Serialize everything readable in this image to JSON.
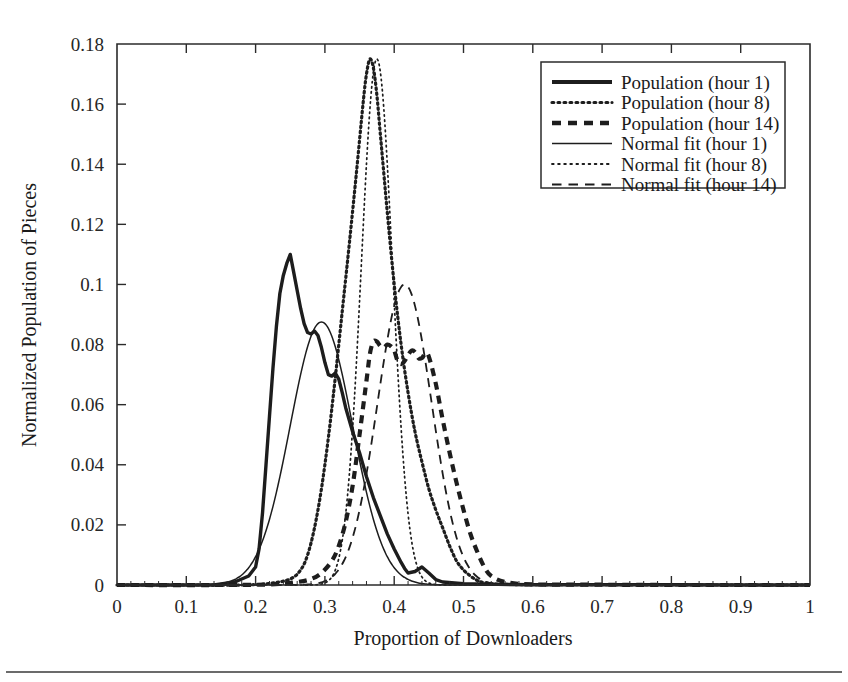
{
  "chart_data": {
    "type": "line",
    "title": "",
    "xlabel": "Proportion of Downloaders",
    "ylabel": "Normalized Population of Pieces",
    "xlim": [
      0,
      1
    ],
    "ylim": [
      0,
      0.18
    ],
    "grid": false,
    "legend_position": "top-right",
    "xticks": [
      "0",
      "0.1",
      "0.2",
      "0.3",
      "0.4",
      "0.5",
      "0.6",
      "0.7",
      "0.8",
      "0.9",
      "1"
    ],
    "xtick_values": [
      0,
      0.1,
      0.2,
      0.3,
      0.4,
      0.5,
      0.6,
      0.7,
      0.8,
      0.9,
      1
    ],
    "yticks": [
      "0",
      "0.02",
      "0.04",
      "0.06",
      "0.08",
      "0.1",
      "0.12",
      "0.14",
      "0.16",
      "0.18"
    ],
    "ytick_values": [
      0,
      0.02,
      0.04,
      0.06,
      0.08,
      0.1,
      0.12,
      0.14,
      0.16,
      0.18
    ],
    "series": [
      {
        "name": "Population (hour 1)",
        "style": "thick-solid",
        "x": [
          0.0,
          0.05,
          0.1,
          0.14,
          0.17,
          0.19,
          0.2,
          0.205,
          0.21,
          0.215,
          0.22,
          0.225,
          0.23,
          0.235,
          0.24,
          0.245,
          0.25,
          0.255,
          0.26,
          0.265,
          0.27,
          0.275,
          0.28,
          0.285,
          0.29,
          0.295,
          0.3,
          0.305,
          0.31,
          0.315,
          0.32,
          0.325,
          0.33,
          0.335,
          0.34,
          0.35,
          0.36,
          0.37,
          0.38,
          0.39,
          0.4,
          0.41,
          0.415,
          0.42,
          0.43,
          0.44,
          0.45,
          0.46,
          0.47,
          0.5,
          0.55,
          0.6,
          0.7,
          0.8,
          0.9,
          1.0
        ],
        "y": [
          0.0,
          0.0,
          0.0,
          0.0,
          0.001,
          0.003,
          0.006,
          0.012,
          0.024,
          0.04,
          0.056,
          0.072,
          0.086,
          0.097,
          0.103,
          0.107,
          0.11,
          0.104,
          0.098,
          0.092,
          0.087,
          0.084,
          0.0835,
          0.0845,
          0.083,
          0.079,
          0.074,
          0.07,
          0.0695,
          0.0705,
          0.0685,
          0.064,
          0.059,
          0.055,
          0.051,
          0.044,
          0.036,
          0.029,
          0.023,
          0.017,
          0.012,
          0.0075,
          0.0055,
          0.004,
          0.0045,
          0.006,
          0.004,
          0.0018,
          0.001,
          0.0004,
          0.0002,
          0.0001,
          0.0001,
          0.0001,
          0.0,
          0.0
        ]
      },
      {
        "name": "Population (hour 8)",
        "style": "thick-dotted",
        "x": [
          0.0,
          0.1,
          0.18,
          0.22,
          0.25,
          0.265,
          0.275,
          0.285,
          0.295,
          0.305,
          0.315,
          0.325,
          0.335,
          0.345,
          0.355,
          0.36,
          0.365,
          0.37,
          0.375,
          0.38,
          0.385,
          0.39,
          0.4,
          0.41,
          0.42,
          0.43,
          0.44,
          0.45,
          0.46,
          0.47,
          0.48,
          0.49,
          0.5,
          0.51,
          0.52,
          0.53,
          0.55,
          0.6,
          0.7,
          0.8,
          0.9,
          1.0
        ],
        "y": [
          0.0,
          0.0,
          0.0,
          0.0005,
          0.002,
          0.005,
          0.01,
          0.019,
          0.032,
          0.049,
          0.069,
          0.091,
          0.113,
          0.136,
          0.16,
          0.17,
          0.175,
          0.172,
          0.163,
          0.15,
          0.137,
          0.124,
          0.1,
          0.08,
          0.064,
          0.051,
          0.041,
          0.032,
          0.025,
          0.019,
          0.013,
          0.008,
          0.005,
          0.003,
          0.0015,
          0.0008,
          0.0003,
          0.0001,
          0.0001,
          0.0,
          0.0,
          0.0
        ]
      },
      {
        "name": "Population (hour 14)",
        "style": "thick-dashed",
        "x": [
          0.0,
          0.15,
          0.22,
          0.26,
          0.28,
          0.295,
          0.31,
          0.32,
          0.33,
          0.34,
          0.35,
          0.36,
          0.365,
          0.37,
          0.375,
          0.38,
          0.385,
          0.39,
          0.395,
          0.4,
          0.405,
          0.41,
          0.415,
          0.42,
          0.425,
          0.43,
          0.435,
          0.44,
          0.445,
          0.45,
          0.46,
          0.47,
          0.48,
          0.49,
          0.5,
          0.51,
          0.52,
          0.53,
          0.54,
          0.56,
          0.6,
          0.7,
          0.8,
          0.9,
          1.0
        ],
        "y": [
          0.0,
          0.0,
          0.0002,
          0.001,
          0.002,
          0.004,
          0.008,
          0.013,
          0.021,
          0.033,
          0.05,
          0.068,
          0.077,
          0.081,
          0.081,
          0.0795,
          0.079,
          0.08,
          0.0795,
          0.078,
          0.0745,
          0.0735,
          0.0745,
          0.0765,
          0.078,
          0.0775,
          0.0755,
          0.0755,
          0.077,
          0.076,
          0.067,
          0.055,
          0.044,
          0.034,
          0.025,
          0.017,
          0.011,
          0.006,
          0.003,
          0.001,
          0.0002,
          0.0001,
          0.0,
          0.0,
          0.0
        ]
      },
      {
        "name": "Normal fit (hour 1)",
        "style": "thin-solid",
        "mu": 0.295,
        "sigma": 0.045,
        "peak": 0.0875
      },
      {
        "name": "Normal fit (hour 8)",
        "style": "thin-dotted",
        "mu": 0.375,
        "sigma": 0.0225,
        "peak": 0.175
      },
      {
        "name": "Normal fit (hour 14)",
        "style": "thin-dashed",
        "mu": 0.415,
        "sigma": 0.039,
        "peak": 0.1
      }
    ],
    "legend_entries": [
      "Population (hour 1)",
      "Population (hour 8)",
      "Population (hour 14)",
      "Normal fit (hour 1)",
      "Normal fit (hour 8)",
      "Normal fit (hour 14)"
    ]
  }
}
